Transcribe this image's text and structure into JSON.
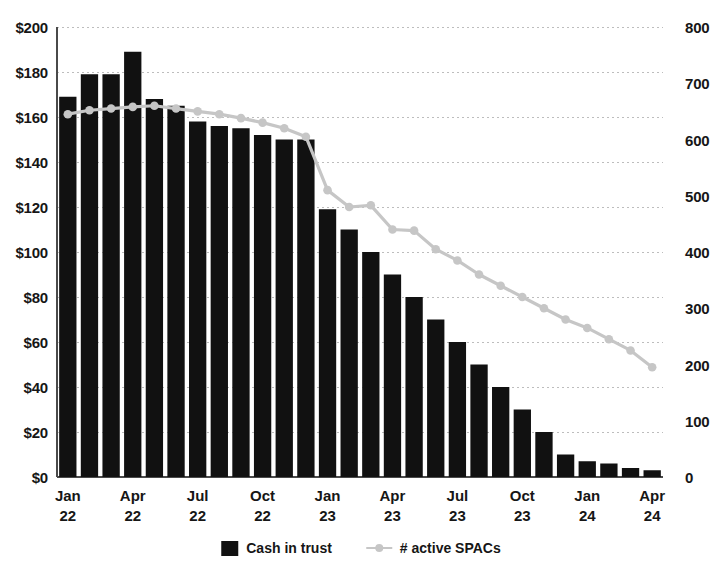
{
  "chart_data": {
    "type": "bar",
    "title": "",
    "subtitle": "",
    "xlabel": "",
    "ylabel": "",
    "y2label": "",
    "grid": true,
    "legend_position": "bottom",
    "categories": [
      "Jan 22",
      "Feb 22",
      "Mar 22",
      "Apr 22",
      "May 22",
      "Jun 22",
      "Jul 22",
      "Aug 22",
      "Sep 22",
      "Oct 22",
      "Nov 22",
      "Dec 22",
      "Jan 23",
      "Feb 23",
      "Mar 23",
      "Apr 23",
      "May 23",
      "Jun 23",
      "Jul 23",
      "Aug 23",
      "Sep 23",
      "Oct 23",
      "Nov 23",
      "Dec 23",
      "Jan 24",
      "Feb 24",
      "Mar 24",
      "Apr 24"
    ],
    "x_tick_labels": [
      {
        "index": 0,
        "line1": "Jan",
        "line2": "22"
      },
      {
        "index": 3,
        "line1": "Apr",
        "line2": "22"
      },
      {
        "index": 6,
        "line1": "Jul",
        "line2": "22"
      },
      {
        "index": 9,
        "line1": "Oct",
        "line2": "22"
      },
      {
        "index": 12,
        "line1": "Jan",
        "line2": "23"
      },
      {
        "index": 15,
        "line1": "Apr",
        "line2": "23"
      },
      {
        "index": 18,
        "line1": "Jul",
        "line2": "23"
      },
      {
        "index": 21,
        "line1": "Oct",
        "line2": "23"
      },
      {
        "index": 24,
        "line1": "Jan",
        "line2": "24"
      },
      {
        "index": 27,
        "line1": "Apr",
        "line2": "24"
      }
    ],
    "series": [
      {
        "name": "Cash in trust",
        "type": "bar",
        "axis": "left",
        "color": "#111111",
        "values": [
          169,
          179,
          179,
          189,
          168,
          165,
          158,
          156,
          155,
          152,
          150,
          150,
          119,
          110,
          100,
          90,
          80,
          70,
          60,
          50,
          40,
          30,
          20,
          10,
          7,
          6,
          4,
          3
        ]
      },
      {
        "name": "# active SPACs",
        "type": "line",
        "axis": "right",
        "color": "#c6c6c6",
        "values": [
          645,
          652,
          655,
          658,
          660,
          655,
          650,
          645,
          638,
          630,
          620,
          605,
          510,
          480,
          483,
          440,
          438,
          405,
          385,
          360,
          340,
          320,
          300,
          280,
          265,
          245,
          225,
          195
        ]
      }
    ],
    "y_left_axis": {
      "min": 0,
      "max": 200,
      "step": 20,
      "tick_labels": [
        "$0",
        "$20",
        "$40",
        "$60",
        "$80",
        "$100",
        "$120",
        "$140",
        "$160",
        "$180",
        "$200"
      ]
    },
    "y_right_axis": {
      "min": 0,
      "max": 800,
      "step": 100,
      "tick_labels": [
        "0",
        "100",
        "200",
        "300",
        "400",
        "500",
        "600",
        "700",
        "800"
      ]
    }
  },
  "legend": {
    "items": [
      {
        "label": "Cash in trust",
        "marker": "bar-swatch-icon"
      },
      {
        "label": "# active SPACs",
        "marker": "line-marker-icon"
      }
    ]
  }
}
